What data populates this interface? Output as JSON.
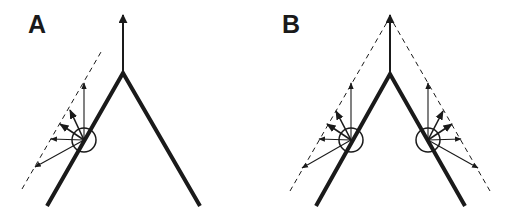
{
  "panels": [
    {
      "label": "A",
      "apex": [
        123,
        73
      ],
      "legs": [
        [
          47,
          206
        ],
        [
          200,
          206
        ]
      ],
      "up_arrow_tip": [
        123,
        15
      ],
      "sites": [
        {
          "center": [
            84,
            140
          ],
          "radius": 12,
          "dashed_line": [
            [
              22,
              189
            ],
            [
              101,
              52
            ]
          ],
          "arrows": [
            [
              84,
              83
            ],
            [
              70,
              110
            ],
            [
              60,
              124
            ],
            [
              51,
              139
            ],
            [
              35,
              167
            ]
          ]
        }
      ]
    },
    {
      "label": "B",
      "apex": [
        390,
        74
      ],
      "legs": [
        [
          316,
          206
        ],
        [
          465,
          206
        ]
      ],
      "up_arrow_tip": [
        390,
        15
      ],
      "sites": [
        {
          "center": [
            351,
            140
          ],
          "radius": 12,
          "dashed_line": [
            [
              290,
              191
            ],
            [
              390,
              17
            ]
          ],
          "arrows": [
            [
              351,
              83
            ],
            [
              336,
              111
            ],
            [
              327,
              124
            ],
            [
              319,
              139
            ],
            [
              302,
              168
            ]
          ]
        },
        {
          "center": [
            428,
            140
          ],
          "radius": 12,
          "dashed_line": [
            [
              490,
              191
            ],
            [
              390,
              17
            ]
          ],
          "arrows": [
            [
              428,
              83
            ],
            [
              443,
              111
            ],
            [
              452,
              124
            ],
            [
              461,
              139
            ],
            [
              478,
              168
            ]
          ]
        }
      ]
    }
  ],
  "colors": {
    "stroke": "#1a1a1a",
    "background": "#ffffff"
  }
}
